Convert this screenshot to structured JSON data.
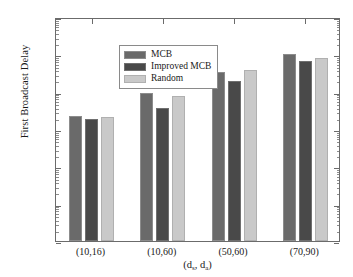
{
  "chart_data": {
    "type": "bar",
    "title": "",
    "xlabel": "(d_s, d_a)",
    "xlabel_parts": {
      "open": "(d",
      "sub1": "s",
      "mid": ", d",
      "sub2": "a",
      "close": ")"
    },
    "ylabel": "First Broadcast Delay",
    "yscale": "log",
    "ylim": [
      1,
      1000000
    ],
    "ytick_labels": [
      "10^0",
      "10^1",
      "10^2",
      "10^3",
      "10^4",
      "10^5",
      "10^6"
    ],
    "ytick_mantissas": [
      "10",
      "10",
      "10",
      "10",
      "10",
      "10",
      "10"
    ],
    "ytick_exponents": [
      "0",
      "1",
      "2",
      "3",
      "4",
      "5",
      "6"
    ],
    "grid": false,
    "legend_position": "upper left",
    "categories": [
      "(10,16)",
      "(10,60)",
      "(50,60)",
      "(70,90)"
    ],
    "series": [
      {
        "name": "MCB",
        "color": "#6a6a6a",
        "values": [
          2300,
          9000,
          33000,
          100000
        ]
      },
      {
        "name": "Improved MCB",
        "color": "#494949",
        "values": [
          1800,
          3600,
          19000,
          65000
        ]
      },
      {
        "name": "Random",
        "color": "#c9c9c9",
        "values": [
          2100,
          7800,
          38000,
          80000
        ]
      }
    ]
  },
  "legend": {
    "items": [
      {
        "label": "MCB",
        "swatch": "legend-swatch-mcb"
      },
      {
        "label": "Improved MCB",
        "swatch": "legend-swatch-improved-mcb"
      },
      {
        "label": "Random",
        "swatch": "legend-swatch-random"
      }
    ]
  }
}
